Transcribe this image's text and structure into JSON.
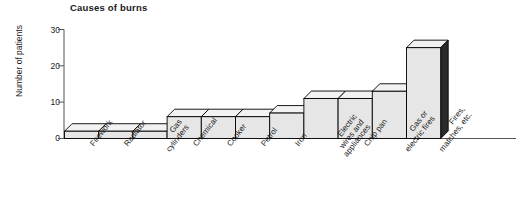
{
  "chart_data": {
    "type": "bar",
    "title": "Causes of burns",
    "xlabel": "",
    "ylabel": "Number of patients",
    "ylim": [
      0,
      30
    ],
    "yticks": [
      0,
      10,
      20,
      30
    ],
    "grid": false,
    "legend": null,
    "style": "3d-bars",
    "categories": [
      "Firework",
      "Radiator",
      "Gas cylinders",
      "Chemical",
      "Cooker",
      "Petrol",
      "Iron",
      "Electric wires and appliances",
      "Chip pan",
      "Gas or electric fires",
      "Fires, matches, etc."
    ],
    "category_lines": [
      [
        "Firework"
      ],
      [
        "Radiator"
      ],
      [
        "Gas",
        "cylinders"
      ],
      [
        "Chemical"
      ],
      [
        "Cooker"
      ],
      [
        "Petrol"
      ],
      [
        "Iron"
      ],
      [
        "Electric",
        "wires and",
        "appliances"
      ],
      [
        "Chip pan"
      ],
      [
        "Gas or",
        "electric fires"
      ],
      [
        "Fires,",
        "matches, etc."
      ]
    ],
    "values": [
      2,
      2,
      2,
      6,
      6,
      6,
      7,
      11,
      11,
      13,
      25
    ],
    "colors": {
      "bar_fill": "#e6e6e6",
      "bar_top_fill": "#f2f2f2",
      "bar_side_fill": "#e0e0e0",
      "bar_stroke": "#000000",
      "highlight_side_fill": "#2b2b2b",
      "axis": "#555555",
      "text": "#1a1a1a"
    }
  }
}
